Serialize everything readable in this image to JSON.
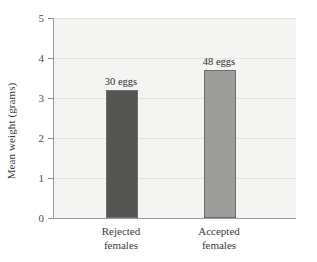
{
  "chart_data": {
    "type": "bar",
    "title": "",
    "subtitle": "",
    "xlabel": "",
    "ylabel": "Mean weight (grams)",
    "categories": [
      "Rejected females",
      "Accepted females"
    ],
    "category_lines": [
      [
        "Rejected",
        "females"
      ],
      [
        "Accepted",
        "females"
      ]
    ],
    "values": [
      3.2,
      3.7
    ],
    "data_labels": [
      "30 eggs",
      "48 eggs"
    ],
    "sample_sizes": [
      30,
      48
    ],
    "ylim": [
      0,
      5
    ],
    "ytick_labels": [
      "0",
      "1",
      "2",
      "3",
      "4",
      "5"
    ],
    "ytick_values": [
      0,
      1,
      2,
      3,
      4,
      5
    ],
    "grid": true,
    "grid_axis": "y",
    "legend": false,
    "legend_position": "none",
    "bar_colors": [
      "#555553",
      "#9c9c9a"
    ],
    "bar_border_color": "#6e6e6c",
    "plot_background": "#f4f4f2",
    "gridline_color": "#e2e2df",
    "axis_color": "#9a9a98",
    "text_color": "#3b3b3b"
  }
}
